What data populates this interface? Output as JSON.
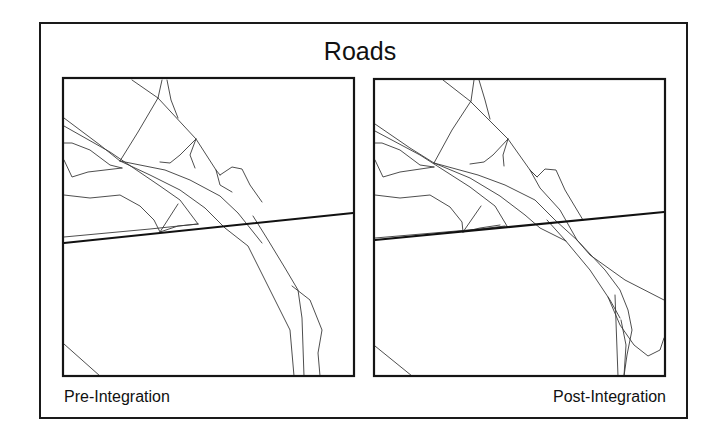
{
  "figure": {
    "title": "Roads",
    "panels": [
      {
        "id": "pre",
        "caption": "Pre-Integration",
        "rect": [
          63,
          78,
          291,
          298
        ],
        "major_roads": [
          [
            [
              64,
              243
            ],
            [
              353,
              213
            ]
          ]
        ],
        "roads": [
          [
            [
              64,
              237
            ],
            [
              150,
              229
            ],
            [
              198,
              224
            ]
          ],
          [
            [
              132,
              80
            ],
            [
              158,
              98
            ],
            [
              196,
              139
            ],
            [
              216,
              170
            ],
            [
              220,
              175
            ]
          ],
          [
            [
              162,
              80
            ],
            [
              158,
              98
            ]
          ],
          [
            [
              167,
              80
            ],
            [
              171,
              100
            ],
            [
              178,
              118
            ]
          ],
          [
            [
              158,
              98
            ],
            [
              138,
              132
            ],
            [
              120,
              161
            ]
          ],
          [
            [
              64,
              118
            ],
            [
              100,
              145
            ],
            [
              120,
              161
            ]
          ],
          [
            [
              64,
              126
            ],
            [
              110,
              152
            ],
            [
              160,
              186
            ],
            [
              180,
              200
            ],
            [
              198,
              224
            ]
          ],
          [
            [
              120,
              161
            ],
            [
              165,
              170
            ],
            [
              190,
              180
            ],
            [
              220,
              196
            ],
            [
              238,
              213
            ],
            [
              262,
              243
            ]
          ],
          [
            [
              120,
              161
            ],
            [
              150,
              175
            ],
            [
              180,
              190
            ],
            [
              205,
              208
            ],
            [
              225,
              228
            ],
            [
              248,
              246
            ],
            [
              268,
              286
            ],
            [
              290,
              330
            ],
            [
              294,
              376
            ]
          ],
          [
            [
              64,
              143
            ],
            [
              72,
              143
            ],
            [
              90,
              150
            ],
            [
              110,
              165
            ],
            [
              122,
              168
            ]
          ],
          [
            [
              64,
              160
            ],
            [
              72,
              177
            ],
            [
              88,
              172
            ],
            [
              122,
              168
            ]
          ],
          [
            [
              64,
              195
            ],
            [
              90,
              198
            ],
            [
              120,
              195
            ],
            [
              140,
              206
            ],
            [
              154,
              220
            ],
            [
              160,
              232
            ]
          ],
          [
            [
              160,
              232
            ],
            [
              178,
              226
            ],
            [
              198,
              224
            ]
          ],
          [
            [
              160,
              232
            ],
            [
              178,
              204
            ]
          ],
          [
            [
              196,
              139
            ],
            [
              180,
              155
            ],
            [
              170,
              163
            ],
            [
              160,
              162
            ]
          ],
          [
            [
              196,
              139
            ],
            [
              190,
              155
            ],
            [
              195,
              168
            ]
          ],
          [
            [
              216,
              170
            ],
            [
              220,
              185
            ],
            [
              232,
              192
            ]
          ],
          [
            [
              220,
              175
            ],
            [
              232,
              167
            ],
            [
              242,
              169
            ],
            [
              250,
              185
            ],
            [
              262,
              202
            ]
          ],
          [
            [
              253,
              216
            ],
            [
              268,
              240
            ],
            [
              285,
              268
            ],
            [
              298,
              290
            ],
            [
              302,
              318
            ],
            [
              304,
              376
            ]
          ],
          [
            [
              292,
              286
            ],
            [
              310,
              300
            ],
            [
              322,
              330
            ],
            [
              318,
              353
            ],
            [
              320,
              376
            ]
          ],
          [
            [
              64,
              344
            ],
            [
              100,
              376
            ]
          ]
        ]
      },
      {
        "id": "post",
        "caption": "Post-Integration",
        "rect": [
          374,
          79,
          291,
          297
        ],
        "major_roads": [
          [
            [
              375,
              240
            ],
            [
              664,
              212
            ]
          ]
        ],
        "roads": [
          [
            [
              375,
              238
            ],
            [
              480,
              229
            ],
            [
              505,
              226
            ]
          ],
          [
            [
              443,
              80
            ],
            [
              470,
              101
            ],
            [
              508,
              139
            ],
            [
              530,
              170
            ],
            [
              537,
              177
            ]
          ],
          [
            [
              474,
              80
            ],
            [
              471,
              101
            ]
          ],
          [
            [
              479,
              80
            ],
            [
              485,
              100
            ],
            [
              490,
              119
            ]
          ],
          [
            [
              471,
              101
            ],
            [
              452,
              130
            ],
            [
              434,
              163
            ]
          ],
          [
            [
              375,
              124
            ],
            [
              410,
              148
            ],
            [
              434,
              163
            ]
          ],
          [
            [
              375,
              131
            ],
            [
              420,
              155
            ],
            [
              470,
              187
            ],
            [
              495,
              206
            ],
            [
              507,
              226
            ]
          ],
          [
            [
              434,
              163
            ],
            [
              478,
              175
            ],
            [
              505,
              185
            ],
            [
              535,
              200
            ],
            [
              555,
              220
            ],
            [
              577,
              240
            ],
            [
              605,
              270
            ],
            [
              620,
              290
            ],
            [
              628,
              310
            ],
            [
              632,
              330
            ],
            [
              627,
              355
            ],
            [
              624,
              376
            ]
          ],
          [
            [
              434,
              163
            ],
            [
              470,
              178
            ],
            [
              500,
              196
            ],
            [
              525,
              215
            ],
            [
              540,
              228
            ],
            [
              566,
              241
            ]
          ],
          [
            [
              375,
              143
            ],
            [
              382,
              143
            ],
            [
              400,
              150
            ],
            [
              420,
              165
            ],
            [
              434,
              167
            ]
          ],
          [
            [
              375,
              160
            ],
            [
              383,
              177
            ],
            [
              400,
              172
            ],
            [
              434,
              167
            ]
          ],
          [
            [
              375,
              195
            ],
            [
              400,
              198
            ],
            [
              430,
              195
            ],
            [
              450,
              207
            ],
            [
              462,
              222
            ],
            [
              463,
              232
            ]
          ],
          [
            [
              463,
              232
            ],
            [
              480,
              228
            ],
            [
              500,
              225
            ]
          ],
          [
            [
              463,
              232
            ],
            [
              481,
              206
            ]
          ],
          [
            [
              508,
              139
            ],
            [
              493,
              155
            ],
            [
              484,
              162
            ],
            [
              470,
              164
            ]
          ],
          [
            [
              508,
              139
            ],
            [
              503,
              155
            ],
            [
              504,
              166
            ]
          ],
          [
            [
              530,
              170
            ],
            [
              537,
              177
            ],
            [
              545,
              169
            ],
            [
              556,
              170
            ],
            [
              565,
              190
            ],
            [
              583,
              220
            ]
          ],
          [
            [
              530,
              170
            ],
            [
              540,
              188
            ],
            [
              560,
              210
            ],
            [
              577,
              240
            ]
          ],
          [
            [
              547,
              220
            ],
            [
              565,
              240
            ],
            [
              590,
              270
            ],
            [
              610,
              300
            ],
            [
              620,
              318
            ]
          ],
          [
            [
              577,
              240
            ],
            [
              590,
              255
            ],
            [
              625,
              280
            ],
            [
              664,
              300
            ]
          ],
          [
            [
              608,
              297
            ],
            [
              620,
              325
            ],
            [
              634,
              345
            ],
            [
              648,
              356
            ],
            [
              660,
              350
            ],
            [
              664,
              338
            ]
          ],
          [
            [
              621,
              320
            ],
            [
              626,
              345
            ],
            [
              624,
              376
            ]
          ],
          [
            [
              615,
              295
            ],
            [
              618,
              376
            ]
          ],
          [
            [
              375,
              346
            ],
            [
              412,
              376
            ]
          ]
        ]
      }
    ]
  }
}
